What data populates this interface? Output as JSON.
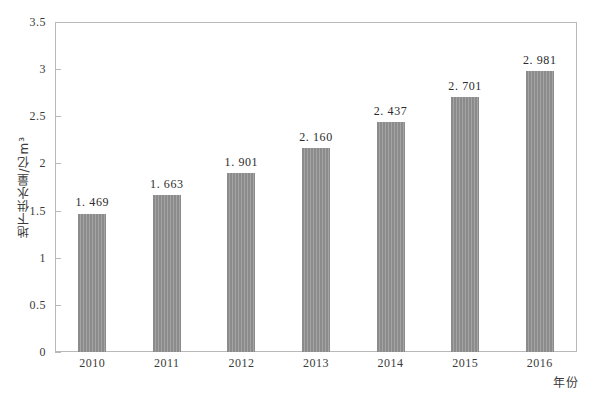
{
  "chart_data": {
    "type": "bar",
    "title": "",
    "xlabel": "年份",
    "ylabel": "地下供水量/亿m³",
    "categories": [
      "2010",
      "2011",
      "2012",
      "2013",
      "2014",
      "2015",
      "2016"
    ],
    "values": [
      1.469,
      1.663,
      1.901,
      2.16,
      2.437,
      2.701,
      2.981
    ],
    "value_labels": [
      "1. 469",
      "1. 663",
      "1. 901",
      "2. 160",
      "2. 437",
      "2. 701",
      "2. 981"
    ],
    "ylim": [
      0,
      3.5
    ],
    "ytick_labels": [
      "0",
      "0.5",
      "1",
      "1.5",
      "2",
      "2.5",
      "3",
      "3.5"
    ],
    "ytick_values": [
      0,
      0.5,
      1,
      1.5,
      2,
      2.5,
      3,
      3.5
    ],
    "grid": false,
    "legend": false,
    "bar_color": "#8b8b8b",
    "frame_color": "#b9b9b9",
    "background": "#ffffff"
  }
}
